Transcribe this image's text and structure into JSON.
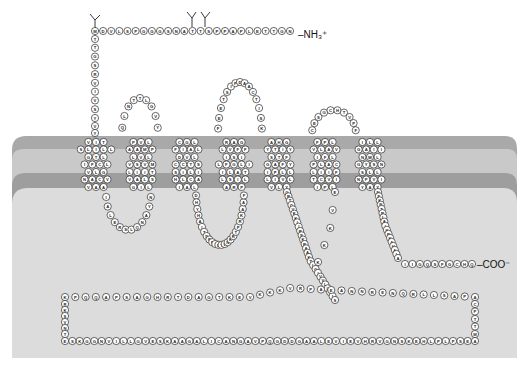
{
  "figure": {
    "colors": {
      "background": "#ffffff",
      "membrane_outer_band": "#a9a9a9",
      "membrane_core": "#c9c9c9",
      "membrane_inner_band": "#9e9e9e",
      "cytoplasm": "#dcdcdc",
      "residue_fill": "#ffffff",
      "residue_stroke": "#2a2a2a"
    },
    "termini": {
      "n_terminus_label": "–NH₃⁺",
      "c_terminus_label": "–COO⁻"
    },
    "n_terminal_tail": {
      "horizontal_sequence": "NGTTELPAPPSTTANSGGGPSLVDM",
      "vertical_sequence": "TTGSRVIVSY",
      "glycosylation_sites": 3
    },
    "transmembrane_helices": [
      {
        "name": "TM1",
        "rows": [
          "VIT",
          "SLILL",
          "GTL",
          "IFCL",
          "VLG",
          "NACV",
          "VAA"
        ]
      },
      {
        "name": "TM2",
        "rows": [
          "PVL",
          "AAMP",
          "LVL",
          "VSVM",
          "LIIT",
          "VALS",
          "GIL"
        ]
      },
      {
        "name": "TM3",
        "rows": [
          "CGL",
          "FIAL",
          "DVL",
          "CCTS",
          "SILI",
          "HLCA",
          "IAL"
        ]
      },
      {
        "name": "TM4",
        "rows": [
          "RAG",
          "LVFF",
          "ISI",
          "LFGLI",
          "ILAT",
          "LSIL",
          "ARP"
        ]
      },
      {
        "name": "TM5",
        "rows": [
          "AHG",
          "YTIY",
          "STF",
          "GAFY",
          "IPLL",
          "LIVL",
          "VLY"
        ]
      },
      {
        "name": "TM6",
        "rows": [
          "FPL",
          "VLAV",
          "IFL",
          "PLAC",
          "LIIF",
          "TCVI",
          "IPL"
        ]
      },
      {
        "name": "TM7",
        "rows": [
          "ILL",
          "GAII",
          "NWL",
          "GYSN",
          "SLL",
          "NPVI",
          "YAY"
        ]
      }
    ],
    "extracellular_loops": [
      {
        "name": "ECL1",
        "sequence": "QLNTTLGVY"
      },
      {
        "name": "ECL2",
        "sequence": "FEETSIPDAACTISK"
      },
      {
        "name": "ECL3",
        "sequence": "CESGCHTVPF"
      }
    ],
    "intracellular_loops": [
      {
        "name": "ICL1",
        "sequence": "IALERSLQNAYN"
      },
      {
        "name": "ICL2",
        "sequence": "DHYHAITDPFIDYVNKRTPRKAAF"
      },
      {
        "name": "ICL3",
        "sequence": "GRTQVKKIIREKRAAKTLGIVVLLFIS"
      }
    ],
    "c_terminal_tail": {
      "descending_sequence": "NFKNTRLAIKRKAHAIA",
      "end_sequence": "IIGQSFGCHQ"
    },
    "large_intracellular_loop": {
      "top_sequence": "KPQQAPSAGHRTDAGTKEVKKKVRPAEANNRENQRLLSAPA",
      "left_sequence": "RKSVNT",
      "bottom_sequence": "ESKGGNVILLGVESKAAGALICANGAVPQGDDGAALEVIEVHRVGNSKEHLPLPSEA",
      "right_sequence": "CPTTM"
    }
  }
}
